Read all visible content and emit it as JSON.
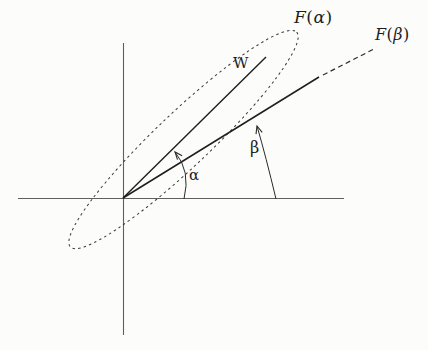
{
  "labels": {
    "w": "W",
    "f_alpha": {
      "f": "F",
      "open": "(",
      "arg": "α",
      "close": ")"
    },
    "f_beta": {
      "f": "F",
      "open": "(",
      "arg": "β",
      "close": ")"
    },
    "alpha": "α",
    "beta": "β"
  },
  "colors": {
    "background": "#fcfcfa",
    "ink": "#1e1e1e",
    "axis": "#5f5f5f",
    "dotted_curve": "#3a3a3a"
  }
}
